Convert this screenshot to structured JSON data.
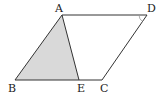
{
  "diagram": {
    "type": "parallelogram",
    "points": {
      "A": {
        "label": "A",
        "x": 62,
        "y": 15
      },
      "D": {
        "label": "D",
        "x": 147,
        "y": 15
      },
      "B": {
        "label": "B",
        "x": 15,
        "y": 80
      },
      "E": {
        "label": "E",
        "x": 79,
        "y": 80
      },
      "C": {
        "label": "C",
        "x": 102,
        "y": 80
      }
    },
    "shaded_triangle": [
      "A",
      "B",
      "E"
    ],
    "angle_mark_at": "D",
    "colors": {
      "stroke": "#333333",
      "shade": "#d9d9d9"
    }
  }
}
